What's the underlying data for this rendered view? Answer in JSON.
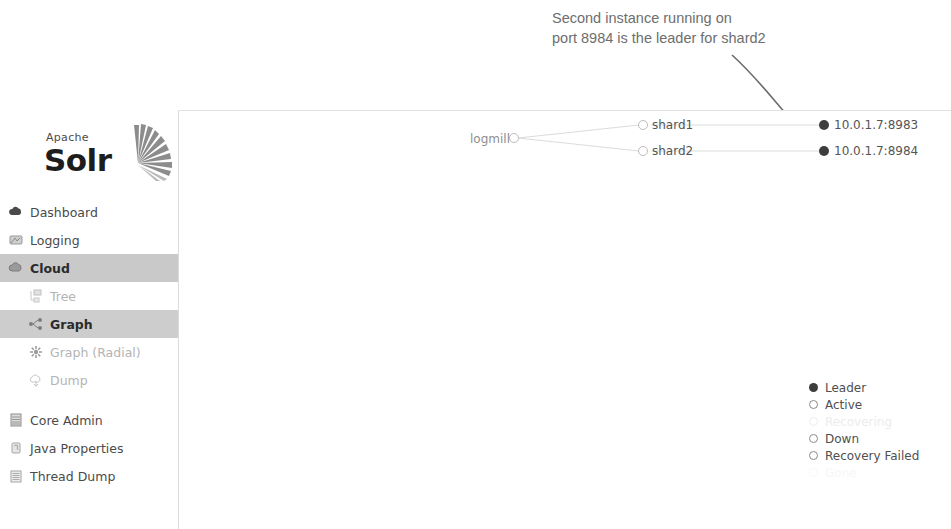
{
  "annotation": {
    "text": "Second instance running on\nport 8984 is the leader for shard2",
    "arrow_color": "#6b6b6b"
  },
  "sidebar": {
    "logo": {
      "apache": "Apache",
      "solr": "Solr"
    },
    "items": [
      {
        "label": "Dashboard",
        "icon": "cloud-dashboard-icon",
        "state": "normal"
      },
      {
        "label": "Logging",
        "icon": "logging-icon",
        "state": "normal"
      },
      {
        "label": "Cloud",
        "icon": "cloud-icon",
        "state": "active"
      }
    ],
    "sub_items": [
      {
        "label": "Tree",
        "icon": "tree-icon",
        "state": "dim"
      },
      {
        "label": "Graph",
        "icon": "graph-icon",
        "state": "active"
      },
      {
        "label": "Graph (Radial)",
        "icon": "graph-radial-icon",
        "state": "dim"
      },
      {
        "label": "Dump",
        "icon": "dump-icon",
        "state": "dim"
      }
    ],
    "bottom_items": [
      {
        "label": "Core Admin",
        "icon": "core-admin-icon",
        "state": "normal"
      },
      {
        "label": "Java Properties",
        "icon": "java-properties-icon",
        "state": "normal"
      },
      {
        "label": "Thread Dump",
        "icon": "thread-dump-icon",
        "state": "normal"
      }
    ]
  },
  "graph": {
    "collection": {
      "label": "logmill",
      "state": "open"
    },
    "shards": [
      {
        "label": "shard1",
        "state": "open"
      },
      {
        "label": "shard2",
        "state": "open"
      }
    ],
    "replicas": [
      {
        "label": "10.0.1.7:8983",
        "state": "leader"
      },
      {
        "label": "10.0.1.7:8984",
        "state": "leader"
      }
    ]
  },
  "legend": {
    "items": [
      {
        "label": "Leader",
        "style": "filled"
      },
      {
        "label": "Active",
        "style": "outline"
      },
      {
        "label": "Recovering",
        "style": "faded"
      },
      {
        "label": "Down",
        "style": "outline"
      },
      {
        "label": "Recovery Failed",
        "style": "outline"
      },
      {
        "label": "Gone",
        "style": "ghost"
      }
    ]
  },
  "colors": {
    "leader_fill": "#3d3d3d",
    "node_outline": "#9a9a9a",
    "edge": "#d8d8d8",
    "active_nav_bg": "#c9c9c9"
  }
}
